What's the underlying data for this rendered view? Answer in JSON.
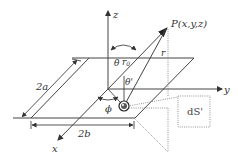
{
  "diagram": {
    "labels": {
      "z_axis": "z",
      "y_axis": "y",
      "x_axis": "x",
      "point": "P(x,y,z)",
      "theta": "θ",
      "r0": "r",
      "r0_sub": "0",
      "r": "r",
      "theta_prime": "θ'",
      "phi": "ϕ",
      "width_a": "2a",
      "width_b": "2b",
      "area_element": "dS'"
    },
    "colors": {
      "line": "#444444",
      "dotted": "#777777",
      "text": "#333333",
      "background": "#ffffff"
    }
  }
}
